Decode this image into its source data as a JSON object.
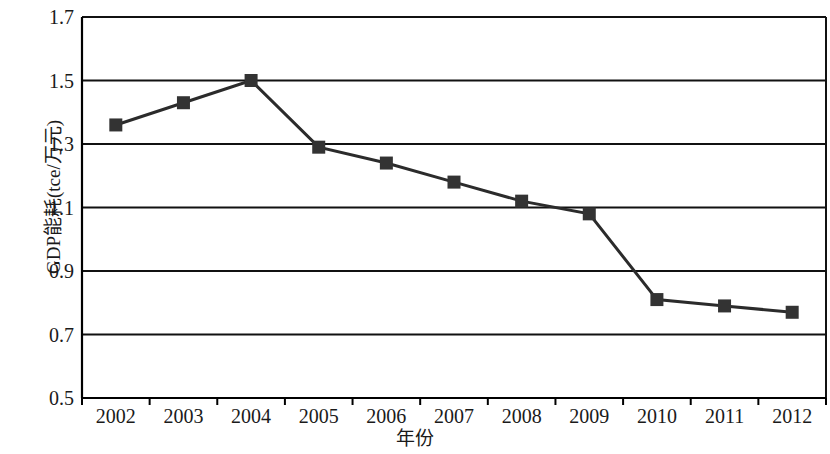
{
  "chart_data": {
    "type": "line",
    "title": "",
    "xlabel": "年份",
    "ylabel": "GDP能耗(tce/万元)",
    "categories": [
      "2002",
      "2003",
      "2004",
      "2005",
      "2006",
      "2007",
      "2008",
      "2009",
      "2010",
      "2011",
      "2012"
    ],
    "values": [
      1.36,
      1.43,
      1.5,
      1.29,
      1.24,
      1.18,
      1.12,
      1.08,
      0.81,
      0.79,
      0.77
    ],
    "series": [
      {
        "name": "GDP能耗",
        "values": [
          1.36,
          1.43,
          1.5,
          1.29,
          1.24,
          1.18,
          1.12,
          1.08,
          0.81,
          0.79,
          0.77
        ],
        "marker": "square",
        "color": "#333333"
      }
    ],
    "ylim": [
      0.5,
      1.7
    ],
    "ytick_labels": [
      "1.7",
      "1.5",
      "1.3",
      "1.1",
      "0.9",
      "0.7",
      "0.5"
    ],
    "ytick_values": [
      1.7,
      1.5,
      1.3,
      1.1,
      0.9,
      0.7,
      0.5
    ],
    "grid": "horizontal",
    "legend": "none",
    "line_color": "#2b2b2b",
    "marker_color": "#333333",
    "axis_color": "#000000"
  }
}
